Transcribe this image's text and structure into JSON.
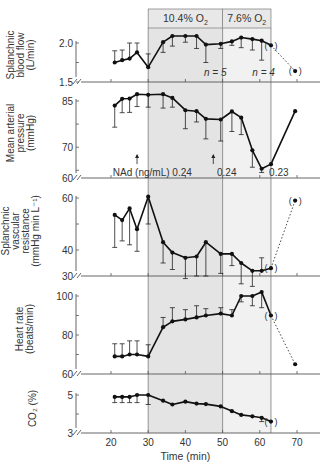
{
  "figure": {
    "xlabel": "Time (min)",
    "x_ticks": [
      20,
      30,
      40,
      50,
      60,
      70
    ],
    "phases": [
      {
        "label": "10.4% O",
        "sub": "2",
        "start": 30,
        "end": 50,
        "color": "#e4e4e4"
      },
      {
        "label": "7.6% O",
        "sub": "2",
        "start": 50,
        "end": 63,
        "color": "#f1f1f1"
      }
    ],
    "header_color": "#e8e8e8",
    "line_color": "#111111",
    "grid_line_color": "#888888"
  },
  "chart_data": [
    {
      "type": "line",
      "panel": "splanchnic-blood-flow",
      "ylabel": [
        "Splanchnic",
        "blood flow",
        "(L/min)"
      ],
      "ylim": [
        1.5,
        2.0
      ],
      "y_ticks": [
        {
          "v": 2.0,
          "label": "2.0"
        },
        {
          "v": 1.75,
          "label": ""
        },
        {
          "v": 1.5,
          "label": "1.5"
        }
      ],
      "x": [
        21,
        23,
        25,
        27,
        30,
        34,
        36.5,
        40,
        43,
        45.5,
        49.5,
        52.5,
        55,
        58,
        60.5
      ],
      "values": [
        1.75,
        1.78,
        1.8,
        1.88,
        1.69,
        2.01,
        2.09,
        2.09,
        2.09,
        1.98,
        1.99,
        2.02,
        2.07,
        2.05,
        2.03
      ],
      "err_upper": [
        0.15,
        0.13,
        0.2,
        0.12,
        0.17,
        0.0,
        0.0,
        0.0,
        0.0,
        0.0,
        0.0,
        0.0,
        0.0,
        0.0,
        0.0
      ],
      "err_lower": [
        0.0,
        0.0,
        0.0,
        0.0,
        0.0,
        0.13,
        0.13,
        0.08,
        0.16,
        0.23,
        0.06,
        0.05,
        0.13,
        0.14,
        0.25
      ],
      "recovery": [
        {
          "x": 63,
          "y": 1.97
        },
        {
          "x": 69.5,
          "y": 1.64
        }
      ],
      "annotations": [
        {
          "text": "n = 5",
          "x": 45,
          "y": 1.62
        },
        {
          "text": "n = 4",
          "x": 58,
          "y": 1.62
        }
      ]
    },
    {
      "type": "line",
      "panel": "mean-arterial-pressure",
      "ylabel": [
        "Mean arterial",
        "pressure",
        "(mmHg)"
      ],
      "ylim": [
        60,
        85
      ],
      "y_ticks": [
        {
          "v": 85,
          "label": "85"
        },
        {
          "v": 77.5,
          "label": ""
        },
        {
          "v": 70,
          "label": "70"
        },
        {
          "v": 62.5,
          "label": ""
        }
      ],
      "baseline_label": "60",
      "x": [
        21,
        23,
        25,
        27,
        30,
        34,
        36.5,
        40,
        43,
        45.5,
        49.5,
        52.5,
        55,
        58,
        60.5,
        63,
        69.5
      ],
      "values": [
        83.5,
        85.7,
        85.8,
        87.2,
        87,
        87.2,
        86,
        82,
        81.7,
        79.2,
        79,
        81.6,
        79.6,
        69,
        63,
        64.5,
        81.7
      ],
      "err_upper": [
        0,
        0,
        0,
        0,
        0,
        0,
        0,
        0,
        0,
        0,
        0,
        0,
        0,
        0,
        0,
        0,
        0
      ],
      "err_lower": [
        7,
        4.5,
        4.5,
        4,
        4,
        4.5,
        3,
        6,
        3.5,
        6.5,
        7,
        6.5,
        5.5,
        5.5,
        1.2,
        0,
        0
      ],
      "recovery": [],
      "annotations": [
        {
          "text": "NAd (ng/mL) 0.24",
          "x": 20.5,
          "y": 61.5
        },
        {
          "text": "0.24",
          "x": 48.5,
          "y": 61.5
        },
        {
          "text": "0.23",
          "x": 62.5,
          "y": 61.5
        }
      ],
      "arrows": [
        {
          "x": 27,
          "y0": 64.5,
          "y1": 67.5
        },
        {
          "x": 47.5,
          "y0": 64.5,
          "y1": 67.5
        }
      ]
    },
    {
      "type": "line",
      "panel": "splanchnic-vascular-resistance",
      "ylabel": [
        "Splanchnic",
        "vascular",
        "resistance",
        "(mmHg min L⁻¹)"
      ],
      "ylim": [
        30,
        60
      ],
      "y_ticks": [
        {
          "v": 60,
          "label": "60"
        },
        {
          "v": 50,
          "label": ""
        },
        {
          "v": 40,
          "label": "40"
        }
      ],
      "baseline_label": "30",
      "x": [
        21,
        23,
        25,
        27,
        30,
        34,
        36.5,
        40,
        43,
        45.5,
        49.5,
        52.5,
        55,
        58,
        60.5
      ],
      "values": [
        53.5,
        51.5,
        56,
        48,
        60.5,
        43,
        39,
        37,
        37.5,
        43,
        38.5,
        38.5,
        35,
        32,
        32
      ],
      "err_upper": [
        0,
        0,
        0,
        0,
        0,
        0,
        0,
        0,
        0,
        0,
        0,
        0,
        0,
        0,
        5
      ],
      "err_lower": [
        12.5,
        8,
        14,
        8.5,
        10.5,
        8,
        6.5,
        8,
        7.5,
        13,
        7.5,
        4.5,
        8,
        6,
        0
      ],
      "recovery": [
        {
          "x": 63,
          "y": 33
        },
        {
          "x": 69.5,
          "y": 59
        }
      ]
    },
    {
      "type": "line",
      "panel": "heart-rate",
      "ylabel": [
        "Heart rate",
        "(beats/min)"
      ],
      "ylim": [
        60,
        100
      ],
      "y_ticks": [
        {
          "v": 100,
          "label": "100"
        },
        {
          "v": 90,
          "label": ""
        },
        {
          "v": 80,
          "label": "80"
        },
        {
          "v": 70,
          "label": ""
        }
      ],
      "baseline_label": "60",
      "x": [
        21,
        23,
        25,
        27,
        30,
        34,
        36.5,
        40,
        43,
        45.5,
        49.5,
        52.5,
        55,
        58,
        60.5
      ],
      "values": [
        69,
        69,
        70,
        70,
        69,
        84,
        87,
        88,
        89,
        90,
        91,
        90,
        100,
        100,
        102
      ],
      "err_upper": [
        6.5,
        6.5,
        7,
        7,
        6,
        5,
        7,
        5,
        6,
        3.5,
        3,
        3,
        0,
        0,
        0
      ],
      "err_lower": [
        0,
        0,
        0,
        0,
        0,
        0,
        0,
        0,
        0,
        0,
        0,
        0,
        3,
        5,
        8
      ],
      "recovery": [
        {
          "x": 63,
          "y": 90
        },
        {
          "x": 69.5,
          "y": 65
        }
      ]
    },
    {
      "type": "line",
      "panel": "co2",
      "ylabel": [
        "CO₂ (%)"
      ],
      "ylim": [
        3,
        5
      ],
      "y_ticks": [
        {
          "v": 5,
          "label": "5"
        },
        {
          "v": 4,
          "label": ""
        }
      ],
      "baseline_label": "3",
      "x": [
        21,
        23,
        25,
        27,
        30,
        34,
        36.5,
        40,
        43,
        45.5,
        49.5,
        52.5,
        55,
        58,
        60.5
      ],
      "values": [
        4.9,
        4.9,
        4.9,
        5.0,
        5.0,
        4.7,
        4.5,
        4.65,
        4.55,
        4.52,
        4.4,
        4.15,
        3.95,
        3.88,
        3.8
      ],
      "err_upper": [
        0,
        0,
        0,
        0,
        0,
        0,
        0,
        0,
        0,
        0,
        0,
        0,
        0,
        0,
        0
      ],
      "err_lower": [
        0.3,
        0.3,
        0.3,
        0.4,
        0.5,
        0,
        0,
        0,
        0,
        0,
        0,
        0,
        0,
        0,
        0.2
      ],
      "recovery": [
        {
          "x": 63,
          "y": 3.6
        }
      ]
    }
  ]
}
